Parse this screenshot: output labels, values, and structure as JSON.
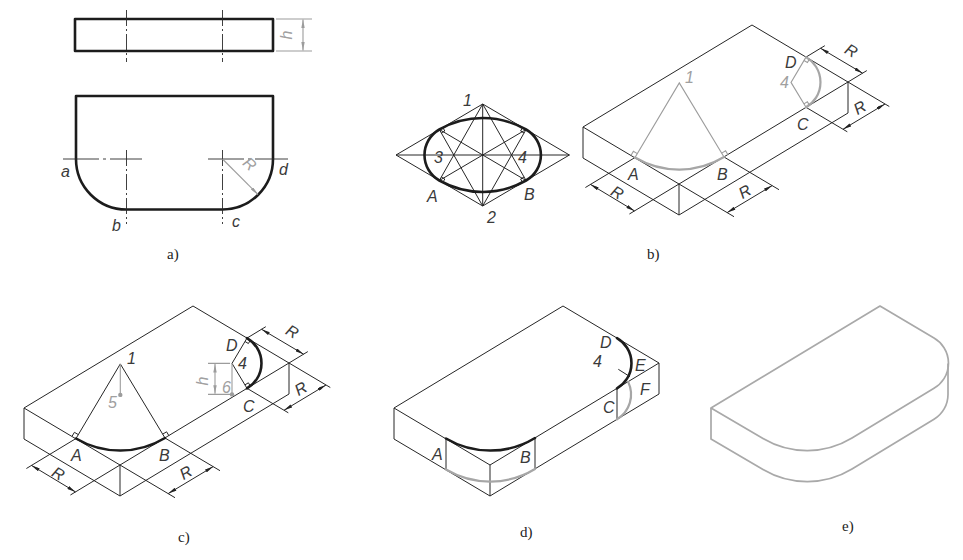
{
  "figure": {
    "a": {
      "caption": "a)",
      "labels": {
        "a": "a",
        "b": "b",
        "c": "c",
        "d": "d"
      },
      "dims": {
        "h": "h",
        "R": "R"
      }
    },
    "b": {
      "caption": "b)",
      "ellipse_labels": {
        "p1": "1",
        "p2": "2",
        "p3": "3",
        "p4": "4",
        "pA": "A",
        "pB": "B"
      },
      "box_labels": {
        "p1": "1",
        "p4": "4",
        "pA": "A",
        "pB": "B",
        "pC": "C",
        "pD": "D"
      },
      "dims": {
        "R_left": "R",
        "R_front": "R",
        "R_top": "R",
        "R_right": "R"
      }
    },
    "c": {
      "caption": "c)",
      "labels": {
        "p1": "1",
        "p4": "4",
        "p5": "5",
        "p6": "6",
        "pA": "A",
        "pB": "B",
        "pC": "C",
        "pD": "D"
      },
      "dims": {
        "h": "h",
        "R_left": "R",
        "R_front": "R",
        "R_top": "R",
        "R_right": "R"
      }
    },
    "d": {
      "caption": "d)",
      "labels": {
        "p4": "4",
        "pA": "A",
        "pB": "B",
        "pC": "C",
        "pD": "D",
        "pE": "E",
        "pF": "F"
      }
    },
    "e": {
      "caption": "e)"
    }
  },
  "colors": {
    "outline": "#1c1c1c",
    "construction": "#9c9c9c",
    "final_shape": "#a9a9a9"
  }
}
